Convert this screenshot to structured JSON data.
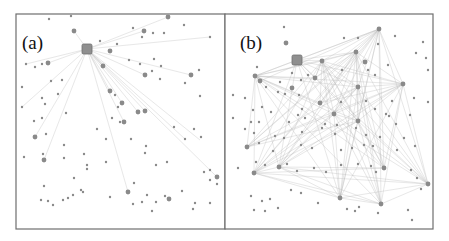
{
  "figure": {
    "panels": [
      {
        "label": "(a)",
        "frame": {
          "x": 16,
          "y": 14,
          "w": 209,
          "h": 215
        },
        "hub": {
          "x": 87,
          "y": 49,
          "size": 10
        },
        "large_nodes": [
          [
            74,
            31
          ],
          [
            144,
            31
          ],
          [
            110,
            51
          ],
          [
            168,
            17
          ],
          [
            48,
            63
          ],
          [
            103,
            66
          ],
          [
            145,
            75
          ],
          [
            110,
            91
          ],
          [
            122,
            103
          ],
          [
            145,
            111
          ],
          [
            124,
            122
          ],
          [
            35,
            137
          ],
          [
            44,
            160
          ],
          [
            128,
            192
          ],
          [
            169,
            199
          ],
          [
            217,
            177
          ],
          [
            191,
            75
          ],
          [
            138,
            112
          ]
        ],
        "small_nodes": [
          [
            49,
            19
          ],
          [
            71,
            16
          ],
          [
            133,
            28
          ],
          [
            153,
            33
          ],
          [
            184,
            25
          ],
          [
            210,
            37
          ],
          [
            142,
            37
          ],
          [
            164,
            33
          ],
          [
            117,
            44
          ],
          [
            129,
            60
          ],
          [
            140,
            64
          ],
          [
            154,
            59
          ],
          [
            161,
            66
          ],
          [
            185,
            83
          ],
          [
            199,
            70
          ],
          [
            26,
            64
          ],
          [
            35,
            67
          ],
          [
            42,
            64
          ],
          [
            51,
            81
          ],
          [
            62,
            80
          ],
          [
            22,
            87
          ],
          [
            42,
            98
          ],
          [
            58,
            94
          ],
          [
            22,
            107
          ],
          [
            45,
            104
          ],
          [
            66,
            113
          ],
          [
            34,
            121
          ],
          [
            42,
            118
          ],
          [
            46,
            134
          ],
          [
            97,
            129
          ],
          [
            112,
            118
          ],
          [
            120,
            122
          ],
          [
            174,
            127
          ],
          [
            194,
            129
          ],
          [
            201,
            137
          ],
          [
            64,
            145
          ],
          [
            106,
            139
          ],
          [
            131,
            139
          ],
          [
            146,
            146
          ],
          [
            185,
            139
          ],
          [
            24,
            157
          ],
          [
            43,
            154
          ],
          [
            64,
            158
          ],
          [
            84,
            154
          ],
          [
            87,
            165
          ],
          [
            87,
            169
          ],
          [
            106,
            162
          ],
          [
            145,
            153
          ],
          [
            156,
            165
          ],
          [
            167,
            162
          ],
          [
            204,
            172
          ],
          [
            210,
            170
          ],
          [
            210,
            180
          ],
          [
            217,
            184
          ],
          [
            44,
            186
          ],
          [
            74,
            178
          ],
          [
            81,
            190
          ],
          [
            73,
            195
          ],
          [
            83,
            192
          ],
          [
            134,
            183
          ],
          [
            156,
            202
          ],
          [
            165,
            196
          ],
          [
            182,
            191
          ],
          [
            48,
            201
          ],
          [
            41,
            200
          ],
          [
            53,
            205
          ],
          [
            63,
            200
          ],
          [
            68,
            198
          ],
          [
            110,
            197
          ],
          [
            133,
            204
          ],
          [
            142,
            202
          ],
          [
            152,
            211
          ],
          [
            193,
            209
          ],
          [
            147,
            195
          ],
          [
            195,
            203
          ],
          [
            210,
            203
          ],
          [
            100,
            41
          ],
          [
            160,
            79
          ],
          [
            152,
            71
          ],
          [
            200,
            96
          ],
          [
            115,
            95
          ],
          [
            118,
            107
          ]
        ],
        "edges": [
          [
            87,
            49,
            168,
            17
          ],
          [
            87,
            49,
            144,
            31
          ],
          [
            87,
            49,
            74,
            31
          ],
          [
            87,
            49,
            48,
            63
          ],
          [
            87,
            49,
            35,
            137
          ],
          [
            87,
            49,
            44,
            160
          ],
          [
            87,
            49,
            128,
            192
          ],
          [
            87,
            49,
            145,
            111
          ],
          [
            87,
            49,
            217,
            177
          ],
          [
            87,
            49,
            191,
            75
          ],
          [
            87,
            49,
            110,
            91
          ],
          [
            87,
            49,
            122,
            103
          ],
          [
            87,
            49,
            200,
            140
          ],
          [
            87,
            49,
            210,
            37
          ],
          [
            87,
            49,
            145,
            75
          ],
          [
            87,
            49,
            103,
            66
          ],
          [
            87,
            49,
            26,
            64
          ],
          [
            87,
            49,
            124,
            122
          ],
          [
            87,
            49,
            138,
            112
          ],
          [
            87,
            49,
            22,
            107
          ],
          [
            87,
            49,
            185,
            139
          ]
        ]
      },
      {
        "label": "(b)",
        "frame": {
          "x": 225,
          "y": 14,
          "w": 208,
          "h": 215
        },
        "hub": {
          "x": 297,
          "y": 60,
          "size": 10
        },
        "large_nodes": [
          [
            286,
            43
          ],
          [
            379,
            29
          ],
          [
            255,
            76
          ],
          [
            260,
            81
          ],
          [
            322,
            61
          ],
          [
            356,
            52
          ],
          [
            315,
            78
          ],
          [
            403,
            84
          ],
          [
            358,
            87
          ],
          [
            320,
            103
          ],
          [
            334,
            114
          ],
          [
            358,
            121
          ],
          [
            247,
            147
          ],
          [
            279,
            167
          ],
          [
            254,
            173
          ],
          [
            384,
            168
          ],
          [
            428,
            184
          ],
          [
            340,
            198
          ],
          [
            381,
            204
          ],
          [
            292,
            88
          ],
          [
            365,
            62
          ]
        ],
        "small_nodes": [
          [
            284,
            27
          ],
          [
            344,
            38
          ],
          [
            358,
            38
          ],
          [
            378,
            44
          ],
          [
            395,
            36
          ],
          [
            423,
            42
          ],
          [
            416,
            53
          ],
          [
            426,
            58
          ],
          [
            342,
            70
          ],
          [
            368,
            70
          ],
          [
            375,
            75
          ],
          [
            388,
            65
          ],
          [
            257,
            67
          ],
          [
            280,
            82
          ],
          [
            292,
            73
          ],
          [
            301,
            80
          ],
          [
            308,
            75
          ],
          [
            266,
            87
          ],
          [
            278,
            92
          ],
          [
            285,
            94
          ],
          [
            299,
            95
          ],
          [
            245,
            98
          ],
          [
            253,
            110
          ],
          [
            262,
            107
          ],
          [
            271,
            112
          ],
          [
            302,
            109
          ],
          [
            341,
            102
          ],
          [
            366,
            101
          ],
          [
            375,
            109
          ],
          [
            392,
            101
          ],
          [
            414,
            98
          ],
          [
            428,
            102
          ],
          [
            251,
            122
          ],
          [
            259,
            122
          ],
          [
            289,
            122
          ],
          [
            298,
            115
          ],
          [
            305,
            118
          ],
          [
            325,
            124
          ],
          [
            337,
            125
          ],
          [
            386,
            114
          ],
          [
            389,
            116
          ],
          [
            396,
            124
          ],
          [
            410,
            115
          ],
          [
            245,
            129
          ],
          [
            254,
            133
          ],
          [
            275,
            136
          ],
          [
            284,
            138
          ],
          [
            302,
            132
          ],
          [
            322,
            128
          ],
          [
            335,
            134
          ],
          [
            356,
            128
          ],
          [
            366,
            135
          ],
          [
            380,
            137
          ],
          [
            404,
            138
          ],
          [
            259,
            143
          ],
          [
            273,
            151
          ],
          [
            301,
            145
          ],
          [
            312,
            148
          ],
          [
            341,
            150
          ],
          [
            352,
            148
          ],
          [
            364,
            145
          ],
          [
            373,
            146
          ],
          [
            397,
            150
          ],
          [
            415,
            146
          ],
          [
            238,
            168
          ],
          [
            256,
            162
          ],
          [
            265,
            165
          ],
          [
            287,
            164
          ],
          [
            297,
            171
          ],
          [
            314,
            168
          ],
          [
            326,
            172
          ],
          [
            341,
            165
          ],
          [
            358,
            164
          ],
          [
            371,
            166
          ],
          [
            376,
            172
          ],
          [
            411,
            170
          ],
          [
            417,
            178
          ],
          [
            421,
            189
          ],
          [
            251,
            196
          ],
          [
            262,
            201
          ],
          [
            270,
            199
          ],
          [
            291,
            190
          ],
          [
            301,
            193
          ],
          [
            318,
            203
          ],
          [
            347,
            209
          ],
          [
            355,
            211
          ],
          [
            359,
            207
          ],
          [
            378,
            213
          ],
          [
            408,
            210
          ],
          [
            412,
            220
          ],
          [
            254,
            210
          ],
          [
            265,
            211
          ],
          [
            278,
            208
          ],
          [
            233,
            95
          ],
          [
            233,
            118
          ],
          [
            428,
            70
          ]
        ],
        "edges_from_hubs": [
          [
            286,
            43
          ],
          [
            379,
            29
          ],
          [
            255,
            76
          ],
          [
            260,
            81
          ],
          [
            322,
            61
          ],
          [
            356,
            52
          ],
          [
            315,
            78
          ],
          [
            403,
            84
          ],
          [
            358,
            87
          ],
          [
            320,
            103
          ],
          [
            334,
            114
          ],
          [
            358,
            121
          ],
          [
            247,
            147
          ],
          [
            279,
            167
          ],
          [
            254,
            173
          ],
          [
            384,
            168
          ],
          [
            428,
            184
          ],
          [
            340,
            198
          ],
          [
            381,
            204
          ],
          [
            297,
            60
          ]
        ]
      }
    ]
  }
}
